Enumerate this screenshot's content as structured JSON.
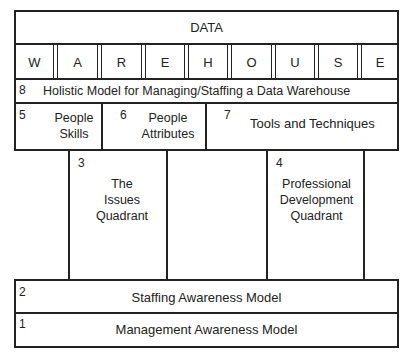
{
  "diagram": {
    "title": "DATA",
    "warehouse_letters": [
      "W",
      "A",
      "R",
      "E",
      "H",
      "O",
      "U",
      "S",
      "E"
    ],
    "layers": [
      {
        "id": "8",
        "label": "Holistic Model for Managing/Staffing a Data Warehouse"
      },
      {
        "id": "5",
        "label_line1": "People",
        "label_line2": "Skills"
      },
      {
        "id": "6",
        "label_line1": "People",
        "label_line2": "Attributes"
      },
      {
        "id": "7",
        "label": "Tools and Techniques"
      },
      {
        "id": "3",
        "label_line1": "The",
        "label_line2": "Issues",
        "label_line3": "Quadrant"
      },
      {
        "id": "4",
        "label_line1": "Professional",
        "label_line2": "Development",
        "label_line3": "Quadrant"
      },
      {
        "id": "2",
        "label": "Staffing Awareness Model"
      },
      {
        "id": "1",
        "label": "Management Awareness Model"
      }
    ]
  }
}
